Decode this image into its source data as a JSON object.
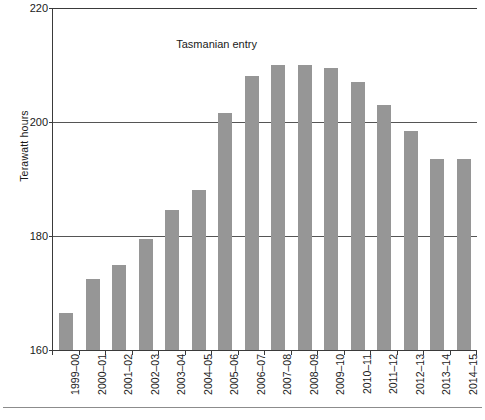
{
  "chart_data": {
    "type": "bar",
    "title": "",
    "xlabel": "",
    "ylabel": "Terawatt hours",
    "ylim": [
      160,
      220
    ],
    "yticks": [
      160,
      180,
      200,
      220
    ],
    "ytick_labels": [
      "160",
      "180",
      "200",
      "220"
    ],
    "grid": true,
    "legend": null,
    "bar_color": "#969696",
    "axis_color": "#3a3a3a",
    "gridline_color": "#555555",
    "categories": [
      "1999–00",
      "2000–01",
      "2001–02",
      "2002–03",
      "2003–04",
      "2004–05",
      "2005–06",
      "2006–07",
      "2007–08",
      "2008–09",
      "2009–10",
      "2010–11",
      "2011–12",
      "2012–13",
      "2013–14",
      "2014–15"
    ],
    "values": [
      166.5,
      172.5,
      175.0,
      179.5,
      184.5,
      188.0,
      201.5,
      208.0,
      210.0,
      210.0,
      209.5,
      207.0,
      203.0,
      198.5,
      193.5,
      193.5
    ],
    "annotations": [
      {
        "text": "Tasmanian entry",
        "x_category": "2003–04",
        "y_value": 213.5
      }
    ]
  },
  "caption": {
    "text": ""
  }
}
